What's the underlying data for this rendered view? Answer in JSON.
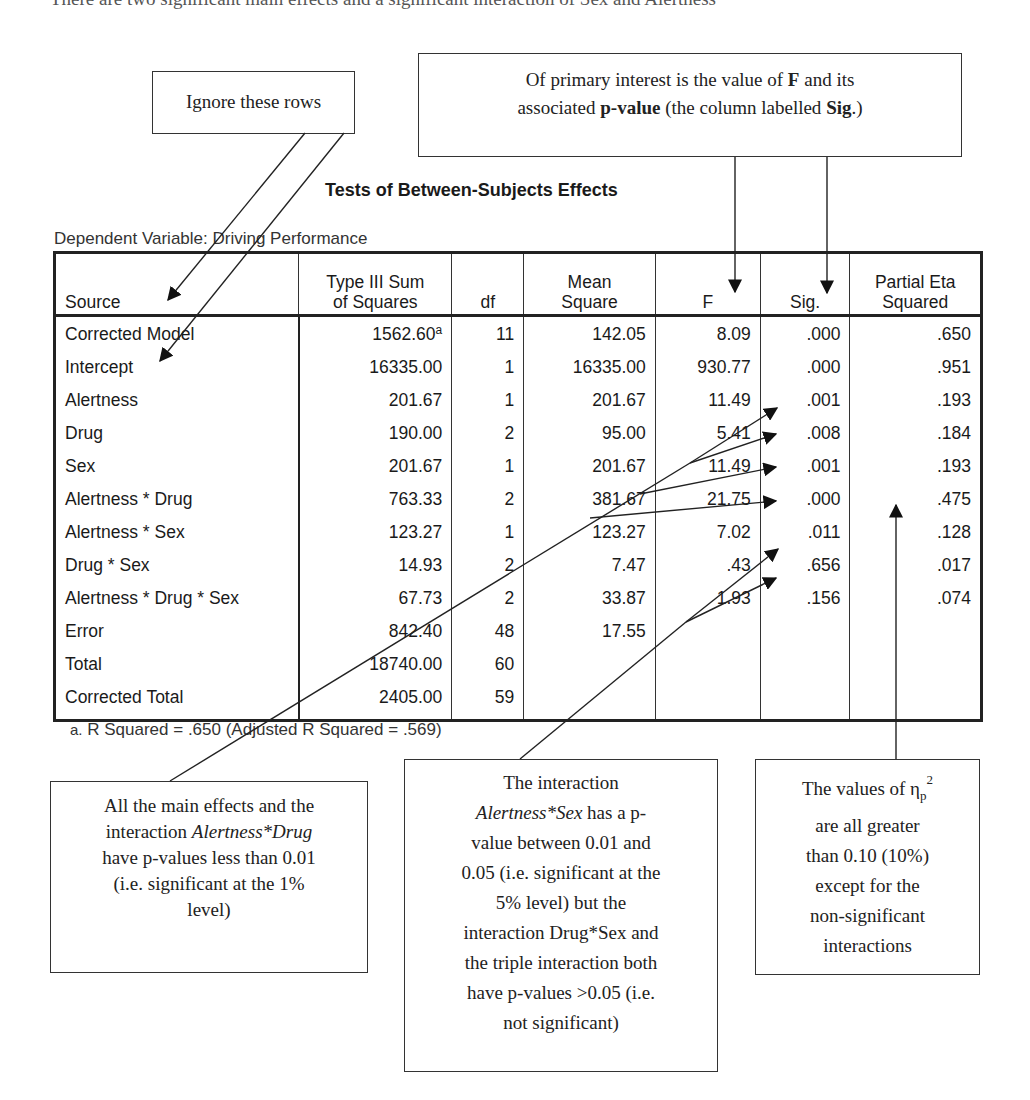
{
  "top_text_fragment": "There are two significant main effects and a significant interaction of Sex and Alertness",
  "callouts": {
    "ignore_rows": "Ignore these rows",
    "primary_interest": {
      "line1_pre": "Of primary interest is the value of ",
      "line1_bold": "F",
      "line1_post": " and its",
      "line2_pre": "associated ",
      "line2_bold": "p-value",
      "line2_mid": " (the column labelled ",
      "line2_bold2": "Sig",
      "line2_post": ".)"
    },
    "main_effects": {
      "l1": "All the main effects and the",
      "l2_pre": "interaction ",
      "l2_italic": "Alertness*Drug",
      "l3": "have p-values less than 0.01",
      "l4": "(i.e. significant at the 1%",
      "l5": "level)"
    },
    "interaction": {
      "l1": "The interaction",
      "l2_italic": "Alertness*Sex",
      "l2_post": " has a p-",
      "l3": "value between 0.01 and",
      "l4": "0.05 (i.e. significant at the",
      "l5": "5% level) but the",
      "l6": "interaction Drug*Sex and",
      "l7": "the triple interaction both",
      "l8": "have p-values >0.05 (i.e.",
      "l9": "not significant)"
    },
    "eta": {
      "l1_pre": "The values of η",
      "l1_sub": "p",
      "l1_sup": "2",
      "l2": "are all greater",
      "l3": "than 0.10 (10%)",
      "l4": "except for the",
      "l5": "non-significant",
      "l6": "interactions"
    }
  },
  "table": {
    "title": "Tests of Between-Subjects Effects",
    "dependent_variable": "Dependent Variable: Driving Performance",
    "headers": {
      "source": "Source",
      "ss_line1": "Type III Sum",
      "ss_line2": "of Squares",
      "df": "df",
      "ms_line1": "Mean",
      "ms_line2": "Square",
      "f": "F",
      "sig": "Sig.",
      "eta_line1": "Partial Eta",
      "eta_line2": "Squared"
    },
    "rows": [
      {
        "source": "Corrected Model",
        "ss": "1562.60",
        "ss_sup": "a",
        "df": "11",
        "ms": "142.05",
        "f": "8.09",
        "sig": ".000",
        "eta": ".650"
      },
      {
        "source": "Intercept",
        "ss": "16335.00",
        "df": "1",
        "ms": "16335.00",
        "f": "930.77",
        "sig": ".000",
        "eta": ".951"
      },
      {
        "source": "Alertness",
        "ss": "201.67",
        "df": "1",
        "ms": "201.67",
        "f": "11.49",
        "sig": ".001",
        "eta": ".193"
      },
      {
        "source": "Drug",
        "ss": "190.00",
        "df": "2",
        "ms": "95.00",
        "f": "5.41",
        "sig": ".008",
        "eta": ".184"
      },
      {
        "source": "Sex",
        "ss": "201.67",
        "df": "1",
        "ms": "201.67",
        "f": "11.49",
        "sig": ".001",
        "eta": ".193"
      },
      {
        "source": "Alertness * Drug",
        "ss": "763.33",
        "df": "2",
        "ms": "381.67",
        "f": "21.75",
        "sig": ".000",
        "eta": ".475"
      },
      {
        "source": "Alertness * Sex",
        "ss": "123.27",
        "df": "1",
        "ms": "123.27",
        "f": "7.02",
        "sig": ".011",
        "eta": ".128"
      },
      {
        "source": "Drug * Sex",
        "ss": "14.93",
        "df": "2",
        "ms": "7.47",
        "f": ".43",
        "sig": ".656",
        "eta": ".017"
      },
      {
        "source": "Alertness * Drug * Sex",
        "ss": "67.73",
        "df": "2",
        "ms": "33.87",
        "f": "1.93",
        "sig": ".156",
        "eta": ".074"
      },
      {
        "source": "Error",
        "ss": "842.40",
        "df": "48",
        "ms": "17.55",
        "f": "",
        "sig": "",
        "eta": ""
      },
      {
        "source": "Total",
        "ss": "18740.00",
        "df": "60",
        "ms": "",
        "f": "",
        "sig": "",
        "eta": ""
      },
      {
        "source": "Corrected Total",
        "ss": "2405.00",
        "df": "59",
        "ms": "",
        "f": "",
        "sig": "",
        "eta": ""
      }
    ],
    "footnote_marker": "a.",
    "footnote": "R Squared = .650 (Adjusted R Squared = .569)"
  }
}
